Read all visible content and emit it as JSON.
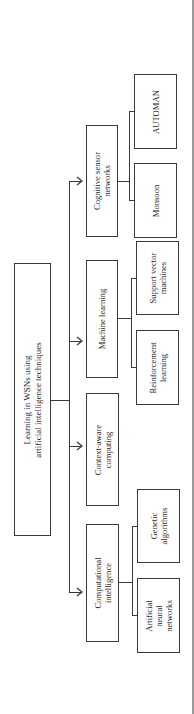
{
  "diagram": {
    "orientation": "rotated-90-ccw",
    "root": {
      "label": "Learning in WSNs using\nartificial intelligence techniques"
    },
    "branches": [
      {
        "label": "Cognitive sensor\nnetworks",
        "children": [
          {
            "label": "AUTOMAN"
          },
          {
            "label": "Monsoon"
          }
        ]
      },
      {
        "label": "Machine learning",
        "children": [
          {
            "label": "Support vector\nmachines"
          },
          {
            "label": "Reinforcement\nlearning"
          }
        ]
      },
      {
        "label": "Context-aware\ncomputing",
        "children": []
      },
      {
        "label": "Computational\nintelligence",
        "children": [
          {
            "label": "Genetic\nalgorithms"
          },
          {
            "label": "Artificial\nneural\nnetworks"
          }
        ]
      }
    ],
    "colors": {
      "line": "#3a3a3a",
      "text": "#2a2a2a",
      "background": "#ffffff",
      "page_edge": "#9a9a9a"
    }
  }
}
